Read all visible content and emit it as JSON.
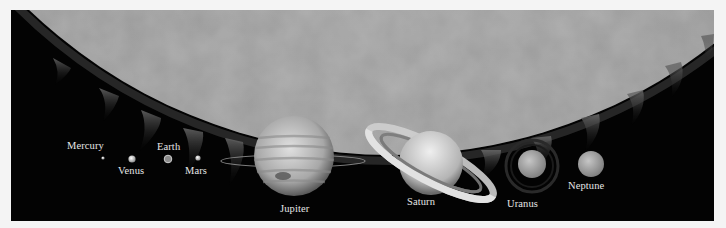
{
  "figure": {
    "background_color": "#030303",
    "sun_color": "#9a9a9a"
  },
  "planets": [
    {
      "name": "Mercury",
      "label_x": 56,
      "label_y": 130
    },
    {
      "name": "Venus",
      "label_x": 107,
      "label_y": 155
    },
    {
      "name": "Earth",
      "label_x": 146,
      "label_y": 131
    },
    {
      "name": "Mars",
      "label_x": 174,
      "label_y": 155
    },
    {
      "name": "Jupiter",
      "label_x": 269,
      "label_y": 193
    },
    {
      "name": "Saturn",
      "label_x": 396,
      "label_y": 186
    },
    {
      "name": "Uranus",
      "label_x": 496,
      "label_y": 188
    },
    {
      "name": "Neptune",
      "label_x": 557,
      "label_y": 170
    }
  ]
}
